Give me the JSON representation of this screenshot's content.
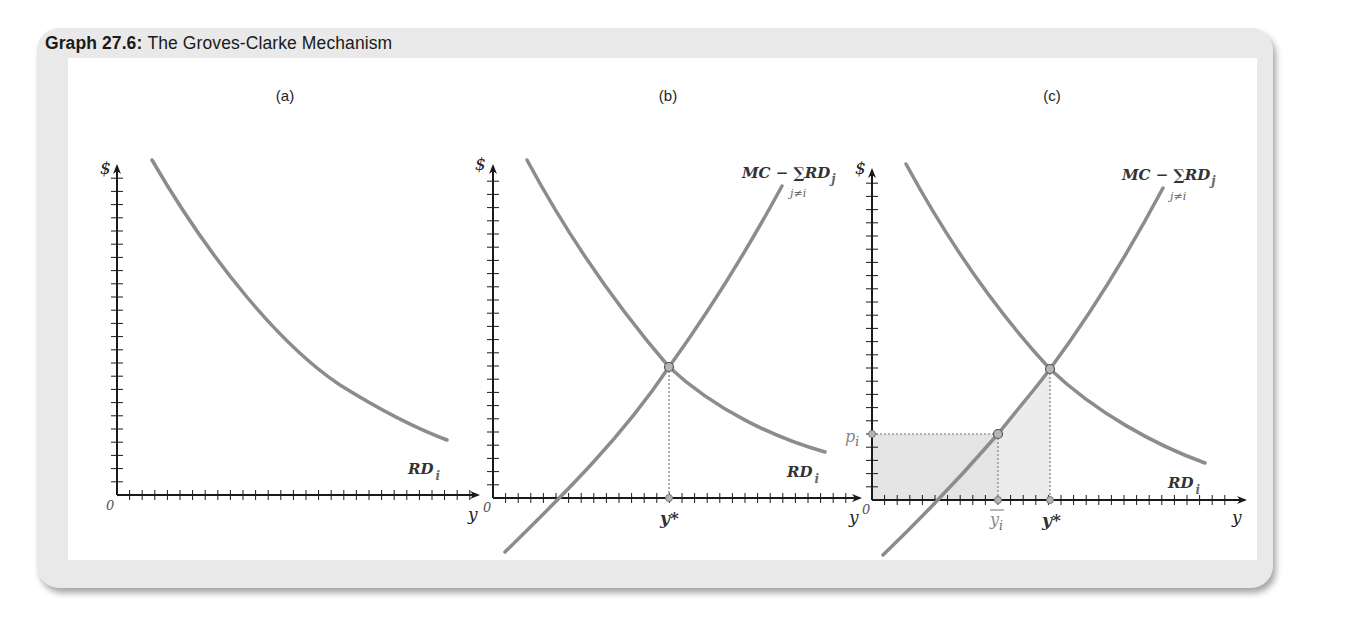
{
  "figure": {
    "title_number": "Graph 27.6:",
    "title_text": "The Groves-Clarke Mechanism"
  },
  "colors": {
    "card_bg": "#e9e9e9",
    "curve": "#8c8c8c",
    "axis": "#1a1a1a",
    "shade": "#e4e4e4",
    "point_fill": "#b5b5b5"
  },
  "chart_data": [
    {
      "type": "line",
      "panel": "(a)",
      "ylabel": "$",
      "xlabel": "y",
      "origin_label": "0",
      "grid": false,
      "series": [
        {
          "name": "RD_i",
          "label": "RD",
          "subscript": "i",
          "shape": "downward-sloping convex",
          "points_px": [
            [
              152,
              160
            ],
            [
              200,
              243
            ],
            [
              260,
              320
            ],
            [
              330,
              385
            ],
            [
              390,
              420
            ],
            [
              445,
              440
            ]
          ]
        }
      ]
    },
    {
      "type": "line",
      "panel": "(b)",
      "ylabel": "$",
      "xlabel": "y",
      "origin_label": "0",
      "grid": false,
      "series": [
        {
          "name": "RD_i",
          "label": "RD",
          "subscript": "i",
          "shape": "downward-sloping convex",
          "points_px": [
            [
              527,
              160
            ],
            [
              580,
              245
            ],
            [
              669,
              367
            ],
            [
              740,
              418
            ],
            [
              825,
              452
            ]
          ]
        },
        {
          "name": "MC - sum_{j!=i} RD_j",
          "label": "MC − ∑RD",
          "subscript": "j",
          "under": "j≠i",
          "shape": "upward-sloping",
          "points_px": [
            [
              505,
              552
            ],
            [
              560,
              498
            ],
            [
              669,
              367
            ],
            [
              735,
              272
            ],
            [
              782,
              186
            ]
          ]
        }
      ],
      "annotations": [
        {
          "text": "y*",
          "x_px": 669,
          "note": "equilibrium quantity where RD_i meets MC − ΣRD_j"
        }
      ],
      "equilibrium_px": [
        669,
        367
      ]
    },
    {
      "type": "line",
      "panel": "(c)",
      "ylabel": "$",
      "xlabel": "y",
      "origin_label": "0",
      "grid": false,
      "series": [
        {
          "name": "RD_i",
          "label": "RD",
          "subscript": "i",
          "shape": "downward-sloping convex",
          "points_px": [
            [
              906,
              164
            ],
            [
              960,
              250
            ],
            [
              1050,
              369
            ],
            [
              1120,
              420
            ],
            [
              1205,
              463
            ]
          ]
        },
        {
          "name": "MC - sum_{j!=i} RD_j",
          "label": "MC − ∑RD",
          "subscript": "j",
          "under": "j≠i",
          "shape": "upward-sloping",
          "points_px": [
            [
              883,
              555
            ],
            [
              940,
              500
            ],
            [
              998,
              434
            ],
            [
              1050,
              369
            ],
            [
              1115,
              278
            ],
            [
              1163,
              188
            ]
          ]
        }
      ],
      "annotations": [
        {
          "text": "p",
          "subscript": "i",
          "y_px": 434,
          "note": "price level on $ axis"
        },
        {
          "text": "y",
          "subscript": "i",
          "overbar": true,
          "x_px": 998
        },
        {
          "text": "y*",
          "x_px": 1050
        }
      ],
      "shaded_regions": [
        {
          "name": "rectangle 0..ȳ_i × 0..p_i",
          "color": "#e4e4e4"
        },
        {
          "name": "area under MC − ΣRD_j from ȳ_i to y*",
          "color": "#ececec"
        }
      ],
      "equilibrium_px": [
        1050,
        369
      ],
      "point_px": [
        998,
        434
      ]
    }
  ],
  "panels": {
    "a": {
      "label": "(a)",
      "dollar": "$",
      "xlabel": "y",
      "origin": "0",
      "rd": "RD",
      "rd_sub": "i"
    },
    "b": {
      "label": "(b)",
      "dollar": "$",
      "xlabel": "y",
      "origin": "0",
      "rd": "RD",
      "rd_sub": "i",
      "mc": "MC − ∑RD",
      "mc_sub": "j",
      "mc_under": "j≠i",
      "ystar": "y*"
    },
    "c": {
      "label": "(c)",
      "dollar": "$",
      "xlabel": "y",
      "origin": "0",
      "rd": "RD",
      "rd_sub": "i",
      "mc": "MC − ∑RD",
      "mc_sub": "j",
      "mc_under": "j≠i",
      "ystar": "y*",
      "p": "p",
      "p_sub": "i",
      "ybar": "y",
      "ybar_sub": "i"
    }
  }
}
